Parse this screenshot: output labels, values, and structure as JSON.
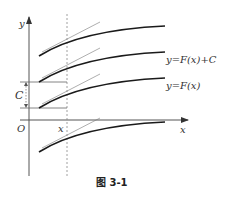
{
  "figure": {
    "caption": "图 3-1",
    "axis_labels": {
      "y": "y",
      "x": "x",
      "origin": "O"
    },
    "point_label": "x",
    "gap_label": "C",
    "curve_labels": [
      {
        "text": "y=F(x)+C"
      },
      {
        "text": "y=F(x)"
      }
    ]
  },
  "colors": {
    "curve": "#1a1a1a",
    "axis": "#555555",
    "tangent": "#777777",
    "dashed": "#888888"
  }
}
